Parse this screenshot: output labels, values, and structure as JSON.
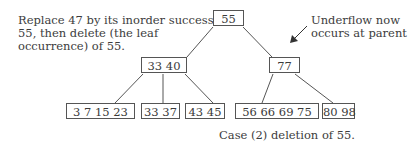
{
  "annotations": {
    "left_note": [
      "Replace 47 by its inorder successor",
      "55, then delete (the leaf",
      "occurrence) of 55."
    ],
    "right_note": [
      "Underflow now",
      "occurs at parent"
    ],
    "caption": "Case (2) deletion of 55."
  },
  "tree": {
    "root": {
      "keys": "55"
    },
    "internal": [
      {
        "keys": "33  40"
      },
      {
        "keys": "77"
      }
    ],
    "leaves": [
      {
        "keys": "3  7 15  23"
      },
      {
        "keys": "33 37"
      },
      {
        "keys": "43  45"
      },
      {
        "keys": "56  66  69  75"
      },
      {
        "keys": "80  98"
      }
    ]
  },
  "colors": {
    "line": "#555555",
    "text": "#3a3a3a"
  }
}
